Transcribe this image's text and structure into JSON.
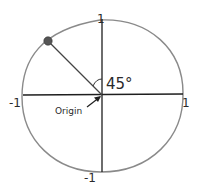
{
  "diagram": {
    "type": "unit-circle",
    "axis_labels": {
      "top": "1",
      "bottom": "-1",
      "left": "-1",
      "right": "1"
    },
    "angle_label": "45°",
    "origin_label": "Origin",
    "colors": {
      "circle": "#8a8a8a",
      "axes": "#1e1e1e",
      "point": "#555555",
      "text": "#2a2a2a"
    }
  }
}
